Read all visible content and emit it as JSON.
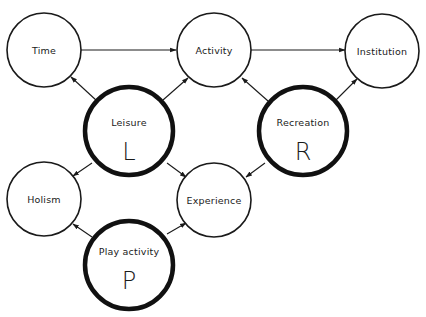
{
  "diagram": {
    "type": "concept-network",
    "nodes": {
      "time": {
        "label": "Time",
        "emphasis": "normal"
      },
      "activity": {
        "label": "Activity",
        "emphasis": "normal"
      },
      "institution": {
        "label": "Institution",
        "emphasis": "normal"
      },
      "leisure": {
        "label": "Leisure",
        "letter": "L",
        "emphasis": "bold"
      },
      "recreation": {
        "label": "Recreation",
        "letter": "R",
        "emphasis": "bold"
      },
      "holism": {
        "label": "Holism",
        "emphasis": "normal"
      },
      "experience": {
        "label": "Experience",
        "emphasis": "normal"
      },
      "play": {
        "label": "Play activity",
        "letter": "P",
        "emphasis": "bold"
      }
    },
    "edges": [
      {
        "from": "Time",
        "to": "Activity"
      },
      {
        "from": "Activity",
        "to": "Institution"
      },
      {
        "from": "Leisure",
        "to": "Time"
      },
      {
        "from": "Leisure",
        "to": "Activity"
      },
      {
        "from": "Leisure",
        "to": "Holism"
      },
      {
        "from": "Leisure",
        "to": "Experience"
      },
      {
        "from": "Recreation",
        "to": "Activity"
      },
      {
        "from": "Recreation",
        "to": "Institution"
      },
      {
        "from": "Recreation",
        "to": "Experience"
      },
      {
        "from": "Play activity",
        "to": "Holism"
      },
      {
        "from": "Play activity",
        "to": "Experience"
      }
    ]
  }
}
